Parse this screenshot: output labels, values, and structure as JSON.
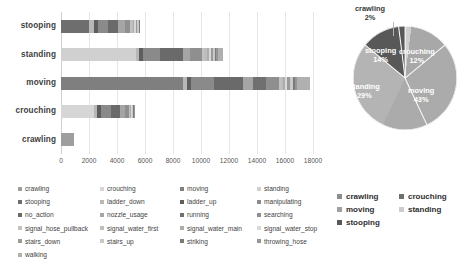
{
  "chart_data": [
    {
      "type": "bar",
      "orientation": "horizontal",
      "stacked": true,
      "title": "",
      "xlabel": "",
      "ylabel": "",
      "xlim": [
        0,
        18000
      ],
      "xticks": [
        0,
        2000,
        4000,
        6000,
        8000,
        10000,
        12000,
        14000,
        16000,
        18000
      ],
      "grid": true,
      "legend_position": "bottom",
      "categories": [
        "stooping",
        "standing",
        "moving",
        "crouching",
        "crawling"
      ],
      "totals": [
        5600,
        11600,
        17000,
        4750,
        950
      ],
      "series": [
        {
          "name": "crawling",
          "color": "#9e9e9e",
          "values": [
            0,
            0,
            0,
            0,
            950
          ]
        },
        {
          "name": "crouching",
          "color": "#d6d6d6",
          "values": [
            0,
            0,
            0,
            2350,
            0
          ]
        },
        {
          "name": "moving",
          "color": "#7f7f7f",
          "values": [
            0,
            0,
            8700,
            0,
            0
          ]
        },
        {
          "name": "standing",
          "color": "#d0d0d0",
          "values": [
            0,
            5350,
            0,
            0,
            0
          ]
        },
        {
          "name": "stooping",
          "color": "#6e6e6e",
          "values": [
            2000,
            0,
            0,
            0,
            0
          ]
        },
        {
          "name": "ladder_down",
          "color": "#b8b8b8",
          "values": [
            350,
            250,
            300,
            250,
            0
          ]
        },
        {
          "name": "ladder_up",
          "color": "#5e5e5e",
          "values": [
            300,
            250,
            300,
            250,
            0
          ]
        },
        {
          "name": "manipulating",
          "color": "#8a8a8a",
          "values": [
            700,
            1250,
            1600,
            700,
            0
          ]
        },
        {
          "name": "no_action",
          "color": "#6a6a6a",
          "values": [
            700,
            1600,
            2100,
            650,
            0
          ]
        },
        {
          "name": "nozzle_usage",
          "color": "#a5a5a5",
          "values": [
            500,
            500,
            700,
            350,
            0
          ]
        },
        {
          "name": "running",
          "color": "#707070",
          "values": [
            0,
            0,
            950,
            0,
            0
          ]
        },
        {
          "name": "searching",
          "color": "#8f8f8f",
          "values": [
            400,
            900,
            900,
            300,
            0
          ]
        },
        {
          "name": "signal_hose_pullback",
          "color": "#c2c2c2",
          "values": [
            100,
            150,
            150,
            50,
            0
          ]
        },
        {
          "name": "signal_water_first",
          "color": "#bdbdbd",
          "values": [
            100,
            150,
            150,
            50,
            0
          ]
        },
        {
          "name": "signal_water_main",
          "color": "#adadad",
          "values": [
            100,
            150,
            150,
            50,
            0
          ]
        },
        {
          "name": "signal_water_stop",
          "color": "#d9d9d9",
          "values": [
            100,
            150,
            150,
            50,
            0
          ]
        },
        {
          "name": "stairs_down",
          "color": "#9a9a9a",
          "values": [
            100,
            150,
            200,
            50,
            0
          ]
        },
        {
          "name": "stairs_up",
          "color": "#c9c9c9",
          "values": [
            100,
            150,
            200,
            50,
            0
          ]
        },
        {
          "name": "striking",
          "color": "#7a7a7a",
          "values": [
            50,
            100,
            150,
            50,
            0
          ]
        },
        {
          "name": "throwing_hose",
          "color": "#969696",
          "values": [
            0,
            100,
            150,
            50,
            0
          ]
        },
        {
          "name": "walking",
          "color": "#b0b0b0",
          "values": [
            0,
            400,
            950,
            0,
            0
          ]
        }
      ]
    },
    {
      "type": "pie",
      "title": "",
      "legend_position": "bottom",
      "labels": [
        "crawling",
        "crouching",
        "moving",
        "standing",
        "stooping"
      ],
      "percents": [
        2,
        12,
        43,
        29,
        14
      ],
      "colors": [
        "#cfcfcf",
        "#a8a8a8",
        "#ababab",
        "#b4b4b4",
        "#585858"
      ],
      "label_texts": [
        {
          "name": "crawling",
          "pct": "2%"
        },
        {
          "name": "crouching",
          "pct": "12%"
        },
        {
          "name": "moving",
          "pct": "43%"
        },
        {
          "name": "standing",
          "pct": "29%"
        },
        {
          "name": "stooping",
          "pct": "14%"
        }
      ]
    }
  ],
  "bar_chart": {
    "y_labels": [
      "stooping",
      "standing",
      "moving",
      "crouching",
      "crawling"
    ],
    "x_tick_labels": [
      "0",
      "2000",
      "4000",
      "6000",
      "8000",
      "10000",
      "12000",
      "14000",
      "16000",
      "18000"
    ]
  },
  "pie_chart": {
    "slices": [
      {
        "label": "crawling",
        "percent_label": "2%"
      },
      {
        "label": "crouching",
        "percent_label": "12%"
      },
      {
        "label": "moving",
        "percent_label": "43%"
      },
      {
        "label": "standing",
        "percent_label": "29%"
      },
      {
        "label": "stooping",
        "percent_label": "14%"
      }
    ]
  },
  "legend_bar": {
    "items": [
      {
        "label": "crawling",
        "color": "#9e9e9e"
      },
      {
        "label": "crouching",
        "color": "#d6d6d6"
      },
      {
        "label": "moving",
        "color": "#7f7f7f"
      },
      {
        "label": "standing",
        "color": "#d0d0d0"
      },
      {
        "label": "stooping",
        "color": "#6e6e6e"
      },
      {
        "label": "ladder_down",
        "color": "#b8b8b8"
      },
      {
        "label": "ladder_up",
        "color": "#5e5e5e"
      },
      {
        "label": "manipulating",
        "color": "#8a8a8a"
      },
      {
        "label": "no_action",
        "color": "#6a6a6a"
      },
      {
        "label": "nozzle_usage",
        "color": "#a5a5a5"
      },
      {
        "label": "running",
        "color": "#707070"
      },
      {
        "label": "searching",
        "color": "#8f8f8f"
      },
      {
        "label": "signal_hose_pullback",
        "color": "#c2c2c2"
      },
      {
        "label": "signal_water_first",
        "color": "#bdbdbd"
      },
      {
        "label": "signal_water_main",
        "color": "#adadad"
      },
      {
        "label": "signal_water_stop",
        "color": "#d9d9d9"
      },
      {
        "label": "stairs_down",
        "color": "#9a9a9a"
      },
      {
        "label": "stairs_up",
        "color": "#c9c9c9"
      },
      {
        "label": "striking",
        "color": "#7a7a7a"
      },
      {
        "label": "throwing_hose",
        "color": "#969696"
      },
      {
        "label": "walking",
        "color": "#b0b0b0"
      }
    ]
  },
  "legend_pie": {
    "items": [
      {
        "label": "crawling",
        "color": "#8c8c8c"
      },
      {
        "label": "crouching",
        "color": "#6f6f6f"
      },
      {
        "label": "moving",
        "color": "#a0a0a0"
      },
      {
        "label": "standing",
        "color": "#cccccc"
      },
      {
        "label": "stooping",
        "color": "#585858"
      }
    ]
  }
}
